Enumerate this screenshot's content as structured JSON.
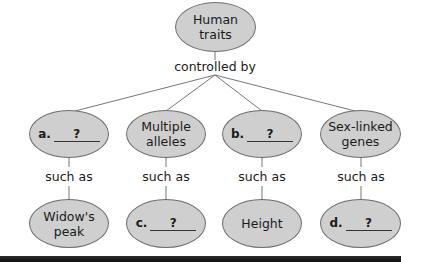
{
  "root": {
    "line1": "Human",
    "line2": "traits"
  },
  "connector_top": "controlled by",
  "connector_mid": "such as",
  "categories": [
    {
      "letter": "a.",
      "blank": "?",
      "example": {
        "line1": "Widow's",
        "line2": "peak"
      }
    },
    {
      "line1": "Multiple",
      "line2": "alleles",
      "example": {
        "letter": "c.",
        "blank": "?"
      }
    },
    {
      "letter": "b.",
      "blank": "?",
      "example": {
        "line1": "Height"
      }
    },
    {
      "line1": "Sex-linked",
      "line2": "genes",
      "example": {
        "letter": "d.",
        "blank": "?"
      }
    }
  ],
  "colors": {
    "node_fill": "#cfcfcf",
    "node_border": "#6e6e6e",
    "bar": "#1a1a1a"
  }
}
